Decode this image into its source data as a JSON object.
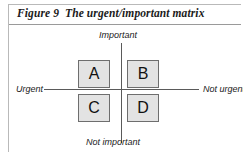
{
  "figure": {
    "number": "Figure 9",
    "title": "The urgent/important matrix"
  },
  "matrix": {
    "axes": {
      "top_label": "Important",
      "bottom_label": "Not important",
      "left_label": "Urgent",
      "right_label": "Not urgent"
    },
    "quadrants": [
      {
        "id": "a",
        "label": "A",
        "position": "urgent-important"
      },
      {
        "id": "b",
        "label": "B",
        "position": "not-urgent-important"
      },
      {
        "id": "c",
        "label": "C",
        "position": "urgent-not-important"
      },
      {
        "id": "d",
        "label": "D",
        "position": "not-urgent-not-important"
      }
    ]
  },
  "colors": {
    "box_fill": "#e3e3e3",
    "box_border": "#6e6e6e",
    "axis": "#5a5a5a",
    "frame": "#b9b9b9",
    "text": "#1a1a1a"
  }
}
